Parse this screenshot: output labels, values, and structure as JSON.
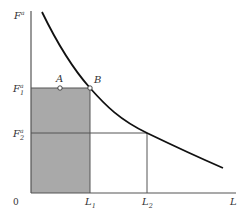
{
  "diagram": {
    "type": "economics-labor-demand-curve",
    "colors": {
      "axis": "#555555",
      "curve": "#111111",
      "shade": "#a9a9a9",
      "guide": "#555555",
      "point_fill": "#ffffff"
    },
    "axes": {
      "y_label": "F",
      "y_label_sup": "a",
      "x_label": "L",
      "origin_label": "0"
    },
    "y_ticks": [
      {
        "label": "F",
        "sup": "a",
        "sub": "1"
      },
      {
        "label": "F",
        "sup": "a",
        "sub": "2"
      }
    ],
    "x_ticks": [
      {
        "label": "L",
        "sub": "1"
      },
      {
        "label": "L",
        "sub": "2"
      }
    ],
    "points": [
      {
        "label": "A"
      },
      {
        "label": "B"
      }
    ],
    "shaded_region": "rectangle 0–L1 by 0–F1a"
  }
}
